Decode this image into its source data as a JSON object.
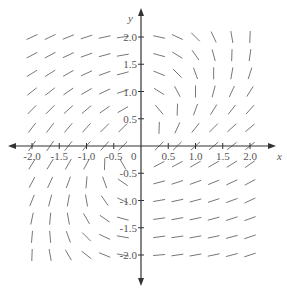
{
  "figure": {
    "type": "slope_field",
    "x_axis": {
      "label": "x",
      "ticks": [
        "-2.0",
        "-1.5",
        "-1.0",
        "-0.5",
        "0.5",
        "1.0",
        "1.5",
        "2.0"
      ],
      "origin_label": "0"
    },
    "y_axis": {
      "label": "y",
      "ticks": [
        "2.0",
        "1.5",
        "1.0",
        "0.5",
        "-0.5",
        "-1.0",
        "-1.5",
        "-2.0"
      ]
    },
    "range": {
      "x": [
        -2,
        2
      ],
      "y": [
        -2,
        2
      ]
    },
    "grid_step": 0.3333,
    "colors": {
      "axis": "#333333",
      "segment": "#777777",
      "text": "#555555"
    },
    "columns_x": [
      -2.0,
      -1.667,
      -1.333,
      -1.0,
      -0.667,
      -0.333,
      0.333,
      0.667,
      1.0,
      1.333,
      1.667,
      2.0
    ],
    "rows_y": [
      2.0,
      1.667,
      1.333,
      1.0,
      0.667,
      0.333,
      0,
      -0.333,
      -0.667,
      -1.0,
      -1.333,
      -1.667,
      -2.0
    ],
    "angles_deg": [
      [
        25,
        25,
        22,
        18,
        12,
        8,
        -12,
        -25,
        -45,
        -65,
        -80,
        88
      ],
      [
        28,
        28,
        25,
        20,
        15,
        10,
        -15,
        -32,
        -55,
        -75,
        88,
        82
      ],
      [
        32,
        32,
        30,
        25,
        20,
        15,
        -22,
        -45,
        -70,
        90,
        80,
        72
      ],
      [
        38,
        38,
        35,
        30,
        25,
        18,
        -32,
        -62,
        90,
        75,
        65,
        58
      ],
      [
        45,
        45,
        42,
        40,
        35,
        30,
        -50,
        88,
        70,
        58,
        52,
        48
      ],
      [
        52,
        52,
        50,
        48,
        45,
        45,
        88,
        65,
        52,
        45,
        42,
        40
      ],
      [
        55,
        55,
        52,
        50,
        48,
        45,
        45,
        45,
        42,
        40,
        38,
        38
      ],
      [
        58,
        58,
        60,
        62,
        88,
        -60,
        28,
        28,
        30,
        30,
        32,
        35
      ],
      [
        62,
        65,
        70,
        85,
        -70,
        -35,
        15,
        18,
        20,
        22,
        25,
        28
      ],
      [
        68,
        75,
        80,
        -80,
        -55,
        -25,
        10,
        12,
        15,
        18,
        20,
        25
      ],
      [
        78,
        85,
        -80,
        -60,
        -35,
        -15,
        8,
        10,
        12,
        15,
        18,
        20
      ],
      [
        85,
        -85,
        -70,
        -45,
        -25,
        -10,
        8,
        8,
        10,
        12,
        15,
        18
      ],
      [
        88,
        -80,
        -60,
        -38,
        -22,
        -10,
        5,
        8,
        10,
        12,
        15,
        18
      ]
    ]
  }
}
